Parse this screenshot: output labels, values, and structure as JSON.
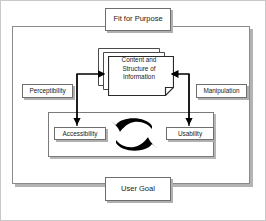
{
  "diagram": {
    "outer_frame_label": "Fit for Purpose",
    "bottom_label": "User Goal",
    "nodes": {
      "fit_for_purpose": "Fit for Purpose",
      "user_goal": "User Goal",
      "perceptibility": "Perceptibility",
      "manipulation": "Manipulation",
      "accessibility": "Accessibility",
      "usability": "Usability",
      "content_line1": "Content and",
      "content_line2": "Structure of",
      "content_line3": "Information",
      "content_full": "Content and Structure of Information"
    },
    "colors": {
      "background": "#ffffff",
      "line": "#000000",
      "box_border": "#6e6e6e",
      "frame_border": "#8a8a8a",
      "shadow": "#b3b3b3",
      "text": "#1a1a1a"
    },
    "connectors": [
      {
        "name": "accessibility-to-content",
        "from": "accessibility",
        "to": "content_full",
        "bidirectional": true
      },
      {
        "name": "usability-to-content",
        "from": "usability",
        "to": "content_full",
        "bidirectional": true
      },
      {
        "name": "accessibility-usability-cycle",
        "from": "accessibility",
        "to": "usability",
        "bidirectional": true
      }
    ]
  }
}
